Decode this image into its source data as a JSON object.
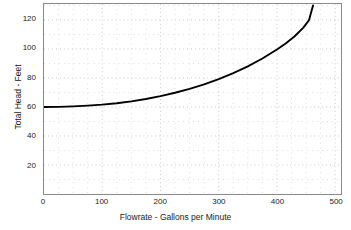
{
  "chart_data": {
    "type": "line",
    "title": "",
    "xlabel": "Flowrate  - Gallons per Minute",
    "ylabel": "Total  Head - Feet",
    "xlim": [
      0,
      510
    ],
    "ylim": [
      0,
      131
    ],
    "grid": true,
    "legend": null,
    "xticks": [
      0,
      100,
      200,
      300,
      400,
      500
    ],
    "xtick_labels": [
      "0",
      "100",
      "200",
      "300",
      "400",
      "500"
    ],
    "yticks": [
      20,
      40,
      60,
      80,
      100,
      120
    ],
    "ytick_labels": [
      "20",
      "40",
      "60",
      "80",
      "100",
      "120"
    ],
    "x_minor_step": 25,
    "y_minor_step": 10,
    "series": [
      {
        "name": "System Head Curve",
        "color": "#000000",
        "width": 1.9,
        "x": [
          0,
          25,
          50,
          75,
          100,
          125,
          150,
          175,
          200,
          225,
          250,
          275,
          300,
          325,
          350,
          375,
          400,
          415,
          430,
          445,
          455,
          462
        ],
        "y": [
          60.0,
          60.1,
          60.4,
          60.9,
          61.6,
          62.6,
          63.9,
          65.5,
          67.5,
          69.8,
          72.5,
          75.6,
          79.2,
          83.3,
          88.0,
          93.4,
          99.6,
          103.8,
          108.6,
          114.5,
          119.8,
          130.0
        ]
      }
    ]
  },
  "axes": {
    "y_title": "Total  Head - Feet",
    "x_title": "Flowrate  - Gallons per Minute"
  },
  "colors": {
    "curve": "#000000",
    "grid_major": "#c9c9c9",
    "grid_minor": "#dedede",
    "frame": "#8a8a8a",
    "text": "#1a1a1a",
    "background": "#ffffff"
  }
}
